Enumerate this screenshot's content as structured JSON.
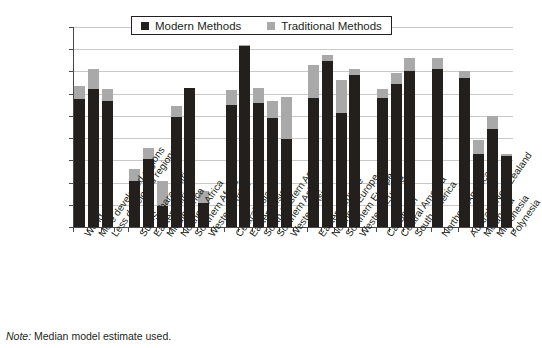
{
  "legend": {
    "items": [
      {
        "label": "Modern Methods",
        "color": "#231f1c",
        "key": "modern"
      },
      {
        "label": "Traditional Methods",
        "color": "#a9a9a9",
        "key": "traditional"
      }
    ]
  },
  "note": {
    "prefix": "Note:",
    "text": " Median model estimate used."
  },
  "axis": {
    "y_ticks": [
      "0",
      "10",
      "20",
      "30",
      "40",
      "50",
      "60",
      "70",
      "80",
      "90"
    ]
  },
  "chart_data": {
    "type": "bar",
    "subtype": "stacked-vertical",
    "title": "",
    "xlabel": "",
    "ylabel": "",
    "ylim": [
      0,
      90
    ],
    "ytick_step": 10,
    "grid": true,
    "legend_position": "top-center",
    "categories": [
      "World",
      "More developed regions",
      "Less developed regions",
      "Sub-Saharan Africa",
      "Eastern Africa",
      "Middle Africa",
      "Northern Africa",
      "Southern Africa",
      "Western Africa",
      "Central Asia",
      "Eastern Asia",
      "South-Eastern Asia",
      "Southern Asia",
      "Western Asia",
      "Eastern Europe",
      "Northern Europe",
      "Southern Europe",
      "Western Europe",
      "Caribbean",
      "Central America",
      "South America",
      "Northern America",
      "Australia/New Zealand",
      "Melanesia",
      "Micronesia",
      "Polynesia"
    ],
    "group_breaks_after": [
      2,
      8,
      13,
      17,
      20,
      21
    ],
    "series": [
      {
        "name": "Modern Methods",
        "color": "#231f1c",
        "values": [
          57.5,
          62.0,
          56.5,
          20.5,
          30.5,
          9.5,
          49.5,
          62.5,
          11.0,
          55.0,
          81.5,
          56.0,
          49.0,
          39.5,
          58.0,
          74.5,
          51.5,
          68.5,
          58.0,
          64.5,
          70.0,
          71.0,
          67.0,
          33.0,
          44.0,
          32.0
        ]
      },
      {
        "name": "Traditional Methods",
        "color": "#a9a9a9",
        "values": [
          6.0,
          9.0,
          5.5,
          5.5,
          5.0,
          11.0,
          5.0,
          0.0,
          5.0,
          6.5,
          0.5,
          6.5,
          7.5,
          19.0,
          15.0,
          3.0,
          14.5,
          2.5,
          4.0,
          5.0,
          6.0,
          5.0,
          3.0,
          6.0,
          6.0,
          1.0
        ]
      }
    ],
    "totals": [
      63.5,
      71.0,
      62.0,
      26.0,
      35.5,
      20.5,
      54.5,
      62.5,
      16.0,
      61.5,
      82.0,
      62.5,
      56.5,
      58.5,
      73.0,
      77.5,
      66.0,
      71.0,
      62.0,
      69.5,
      76.0,
      76.0,
      70.0,
      39.0,
      50.0,
      33.0
    ]
  }
}
